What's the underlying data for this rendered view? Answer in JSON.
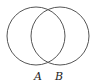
{
  "diagram": {
    "type": "venn",
    "sets": [
      {
        "label": "A",
        "cx": 36,
        "cy": 36,
        "r": 29
      },
      {
        "label": "B",
        "cx": 60,
        "cy": 36,
        "r": 29
      }
    ],
    "stroke_color": "#555555",
    "label_color": "#222222"
  }
}
